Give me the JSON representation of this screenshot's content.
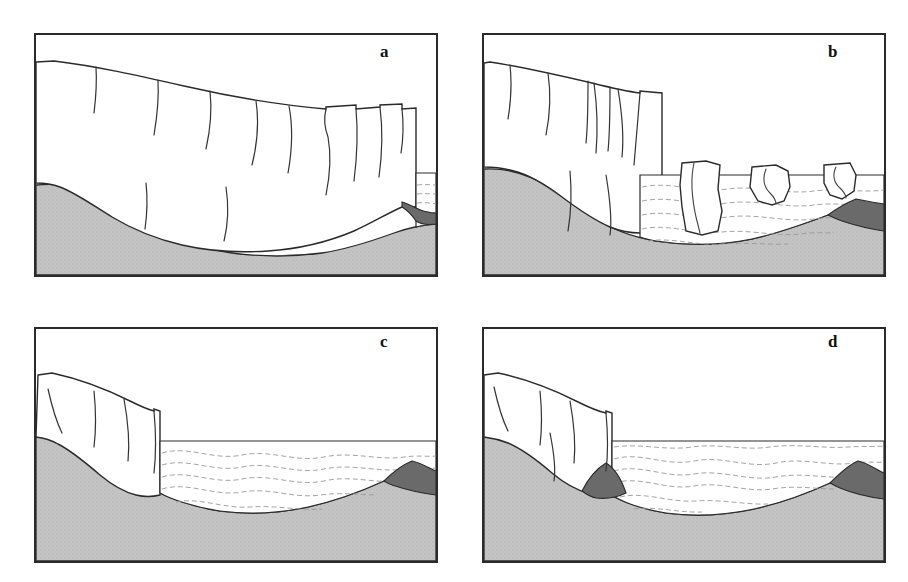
{
  "figure": {
    "type": "scientific-line-diagram",
    "panel_count": 4,
    "width": 908,
    "height": 582,
    "background": "#ffffff"
  },
  "colors": {
    "outline": "#2a2a2a",
    "bedrock_fill": "#c4c4c4",
    "bedrock_stipple": "#a8a8a8",
    "moraine_fill": "#6a6a6a",
    "ice_fill": "#ffffff",
    "water_fill": "#ffffff",
    "water_dash": "#9a9a9a",
    "crevasse_line": "#333333",
    "label_color": "#111111"
  },
  "panels": [
    {
      "id": "panel-a",
      "label": "a",
      "frame": {
        "x": 34,
        "y": 33,
        "w": 404,
        "h": 244
      },
      "label_pos": {
        "x": 378,
        "y": 44
      },
      "stage": "advanced-glacier-grounded-on-shoal",
      "features": {
        "ice_present": true,
        "water_present": true,
        "water_extent": "narrow strip at right margin",
        "water_surface_y": 172,
        "iceberg_count": 0,
        "moraine_wedge_count": 1,
        "crevasse_count": 11,
        "crevasse_note": "surface crevasses deepening toward terminus; full-thickness slots near calving face"
      }
    },
    {
      "id": "panel-b",
      "label": "b",
      "frame": {
        "x": 482,
        "y": 33,
        "w": 404,
        "h": 244
      },
      "label_pos": {
        "x": 826,
        "y": 44
      },
      "stage": "rapid-calving-retreat-icebergs-released",
      "features": {
        "ice_present": true,
        "water_present": true,
        "water_extent": "wide embayment right of terminus",
        "water_surface_y": 175,
        "iceberg_count": 3,
        "moraine_wedge_count": 1,
        "crevasse_count": 9,
        "crevasse_note": "wide through-going rifts splitting the terminus into tabular blocks"
      }
    },
    {
      "id": "panel-c",
      "label": "c",
      "frame": {
        "x": 34,
        "y": 327,
        "w": 404,
        "h": 236
      },
      "label_pos": {
        "x": 378,
        "y": 338
      },
      "stage": "retreated-terminus-deep-fjord-basin",
      "features": {
        "ice_present": true,
        "water_present": true,
        "water_extent": "fills the entire overdeepened basin",
        "water_surface_y": 447,
        "iceberg_count": 0,
        "moraine_wedge_count": 1,
        "crevasse_count": 4,
        "crevasse_note": "few shallow crevasses on the thinned, steeply sloping tongue"
      }
    },
    {
      "id": "panel-d",
      "label": "d",
      "frame": {
        "x": 482,
        "y": 327,
        "w": 404,
        "h": 236
      },
      "label_pos": {
        "x": 826,
        "y": 338
      },
      "stage": "restabilised-terminus-on-new-morainal-bank",
      "features": {
        "ice_present": true,
        "water_present": true,
        "water_extent": "fills the basin between the two morainal banks",
        "water_surface_y": 447,
        "iceberg_count": 0,
        "moraine_wedge_count": 2,
        "crevasse_count": 5,
        "crevasse_note": "crevasses on tongue; new morainal bank built at the grounding line"
      }
    }
  ],
  "legend_implicit": {
    "white_area": "glacier ice",
    "light_grey_stipple": "bedrock / substrate",
    "dark_grey_wedge": "morainal bank / sediment wedge",
    "dashed_wavy_lines": "sea water",
    "thin_curved_lines_in_ice": "crevasses"
  }
}
